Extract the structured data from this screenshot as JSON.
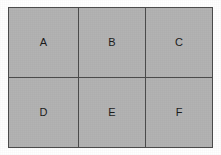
{
  "figure": {
    "kind": "grid-diagram",
    "background_color": "#ffffff",
    "cell_fill_color": "#b3b3b3",
    "line_color": "#4c4c4c",
    "text_color": "#1c1c1c",
    "rows": 2,
    "columns": 3
  },
  "grid": {
    "cells": [
      {
        "label": "A",
        "row": 1,
        "column": 1
      },
      {
        "label": "B",
        "row": 1,
        "column": 2
      },
      {
        "label": "C",
        "row": 1,
        "column": 3
      },
      {
        "label": "D",
        "row": 2,
        "column": 1
      },
      {
        "label": "E",
        "row": 2,
        "column": 2
      },
      {
        "label": "F",
        "row": 2,
        "column": 3
      }
    ]
  }
}
